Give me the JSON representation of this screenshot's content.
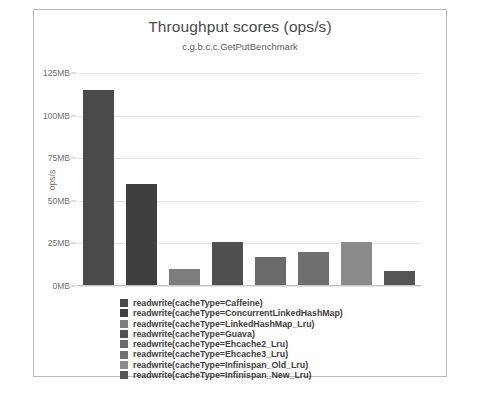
{
  "chart_data": {
    "type": "bar",
    "title": "Throughput scores (ops/s)",
    "subtitle": "c.g.b.c.c.GetPutBenchmark",
    "xlabel": "",
    "ylabel": "ops/s",
    "ylim": [
      0,
      125
    ],
    "ytick_labels": [
      "0MB",
      "25MB",
      "50MB",
      "75MB",
      "100MB",
      "125MB"
    ],
    "ytick_values": [
      0,
      25,
      50,
      75,
      100,
      125
    ],
    "grid": true,
    "legend_position": "bottom",
    "unit": "MB",
    "categories": [
      "readwrite(cacheType=Caffeine)",
      "readwrite(cacheType=ConcurrentLinkedHashMap)",
      "readwrite(cacheType=LinkedHashMap_Lru)",
      "readwrite(cacheType=Guava)",
      "readwrite(cacheType=Ehcache2_Lru)",
      "readwrite(cacheType=Ehcache3_Lru)",
      "readwrite(cacheType=Infinispan_Old_Lru)",
      "readwrite(cacheType=Infinispan_New_Lru)"
    ],
    "values": [
      115,
      60,
      10,
      26,
      17,
      20,
      26,
      9
    ],
    "colors": [
      "#4a4a4a",
      "#3f3f3f",
      "#7d7d7d",
      "#4f4f4f",
      "#6a6a6a",
      "#6f6f6f",
      "#8a8a8a",
      "#555555"
    ]
  },
  "legend": {
    "items": [
      {
        "label": "readwrite(cacheType=Caffeine)",
        "color": "#4a4a4a"
      },
      {
        "label": "readwrite(cacheType=ConcurrentLinkedHashMap)",
        "color": "#3f3f3f"
      },
      {
        "label": "readwrite(cacheType=LinkedHashMap_Lru)",
        "color": "#7d7d7d"
      },
      {
        "label": "readwrite(cacheType=Guava)",
        "color": "#4f4f4f"
      },
      {
        "label": "readwrite(cacheType=Ehcache2_Lru)",
        "color": "#6a6a6a"
      },
      {
        "label": "readwrite(cacheType=Ehcache3_Lru)",
        "color": "#6f6f6f"
      },
      {
        "label": "readwrite(cacheType=Infinispan_Old_Lru)",
        "color": "#8a8a8a"
      },
      {
        "label": "readwrite(cacheType=Infinispan_New_Lru)",
        "color": "#555555"
      }
    ]
  }
}
